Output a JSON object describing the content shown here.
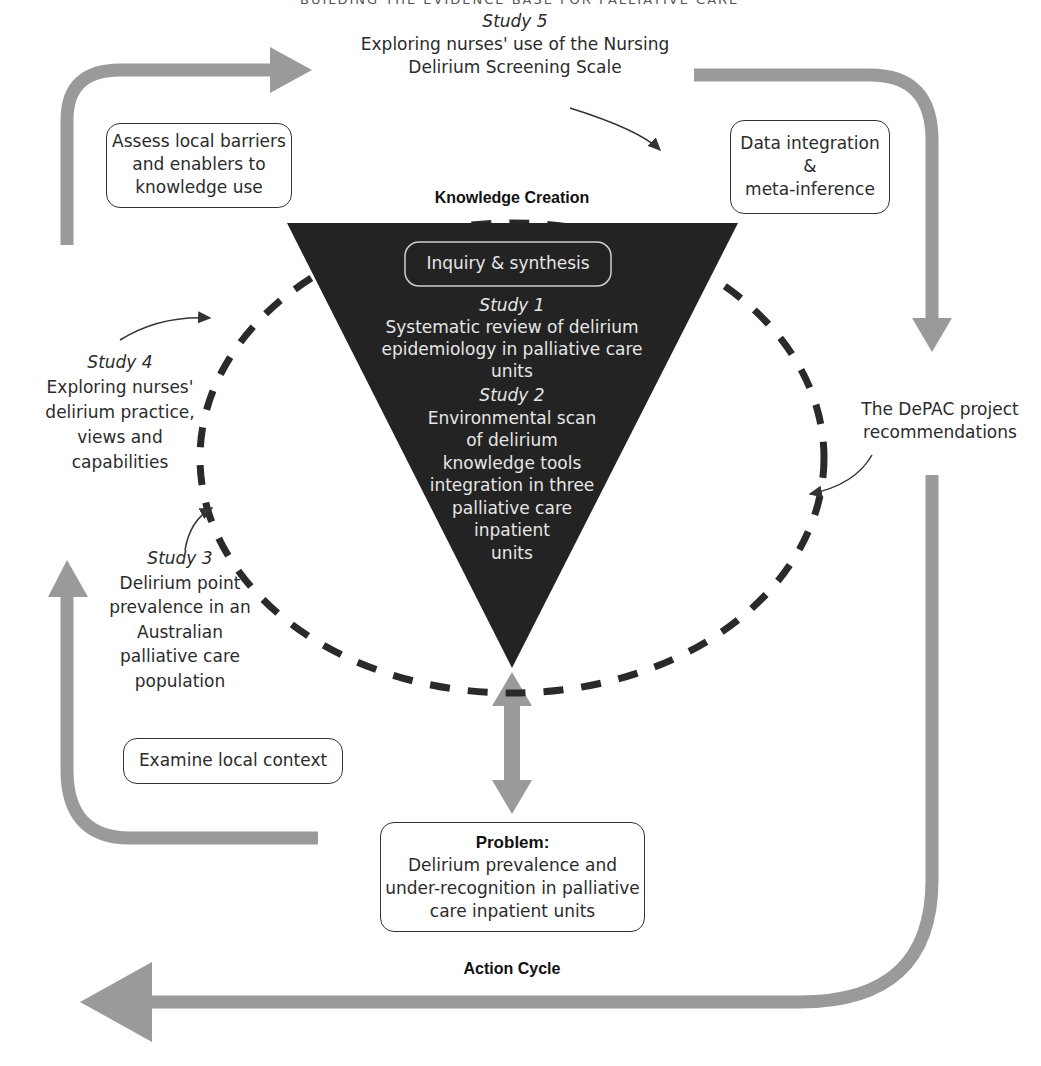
{
  "header": {
    "running_title": "BUILDING THE EVIDENCE BASE FOR PALLIATIVE CARE"
  },
  "colors": {
    "arrow_gray": "#9a9a9a",
    "triangle_fill": "#232323",
    "dash_circle": "#2a2a2a",
    "box_border": "#333333",
    "text": "#2b2b2b",
    "triangle_text": "#e6e6e6"
  },
  "diagram": {
    "title_knowledge": "Knowledge Creation",
    "title_action": "Action Cycle",
    "triangle": {
      "box_label": "Inquiry & synthesis",
      "study1": {
        "label": "Study 1",
        "lines": [
          "Systematic review of delirium",
          "epidemiology in palliative care",
          "units"
        ]
      },
      "study2": {
        "label": "Study 2",
        "lines": [
          "Environmental scan",
          "of delirium",
          "knowledge tools",
          "integration in three",
          "palliative care",
          "inpatient",
          "units"
        ]
      }
    },
    "study5": {
      "label": "Study 5",
      "lines": [
        "Exploring nurses' use of the Nursing",
        "Delirium Screening Scale"
      ]
    },
    "study4": {
      "label": "Study 4",
      "lines": [
        "Exploring nurses'",
        "delirium practice,",
        "views and",
        "capabilities"
      ]
    },
    "study3": {
      "label": "Study 3",
      "lines": [
        "Delirium point",
        "prevalence in an",
        "Australian",
        "palliative care",
        "population"
      ]
    },
    "boxes": {
      "assess": [
        "Assess local barriers",
        "and enablers to",
        "knowledge use"
      ],
      "data_integration": [
        "Data integration",
        "&",
        "meta-inference"
      ],
      "examine": [
        "Examine local context"
      ],
      "problem": {
        "title": "Problem:",
        "lines": [
          "Delirium prevalence and",
          "under-recognition in palliative",
          "care inpatient units"
        ]
      }
    },
    "recommendations": [
      "The DePAC project",
      "recommendations"
    ]
  }
}
